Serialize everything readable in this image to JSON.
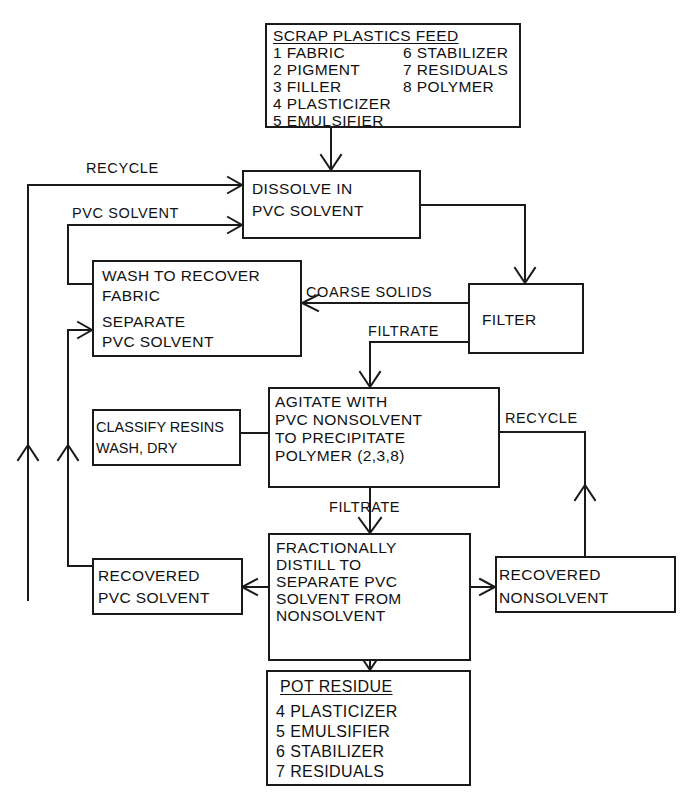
{
  "feed": {
    "title": "SCRAP PLASTICS FEED",
    "items_left": [
      "1  FABRIC",
      "2  PIGMENT",
      "3  FILLER",
      "4  PLASTICIZER",
      "5  EMULSIFIER"
    ],
    "items_right": [
      "6  STABILIZER",
      "7  RESIDUALS",
      "8  POLYMER"
    ]
  },
  "dissolve": {
    "lines": [
      "DISSOLVE  IN",
      "PVC  SOLVENT"
    ]
  },
  "wash": {
    "lines": [
      "WASH  TO  RECOVER",
      "FABRIC",
      "SEPARATE",
      "PVC  SOLVENT"
    ]
  },
  "filter": {
    "label": "FILTER"
  },
  "agitate": {
    "lines": [
      "AGITATE  WITH",
      "PVC  NONSOLVENT",
      "TO  PRECIPITATE",
      "POLYMER  (2,3,8)"
    ]
  },
  "classify": {
    "lines": [
      "CLASSIFY RESINS",
      "WASH, DRY"
    ]
  },
  "distill": {
    "lines": [
      "FRACTIONALLY",
      "DISTILL  TO",
      "SEPARATE  PVC",
      "SOLVENT  FROM",
      "NONSOLVENT"
    ]
  },
  "recovered_solvent": {
    "lines": [
      "RECOVERED",
      "PVC  SOLVENT"
    ]
  },
  "recovered_nonsolvent": {
    "lines": [
      "RECOVERED",
      "NONSOLVENT"
    ]
  },
  "pot_residue": {
    "title": "POT  RESIDUE",
    "items": [
      "4  PLASTICIZER",
      "5  EMULSIFIER",
      "6  STABILIZER",
      "7  RESIDUALS"
    ]
  },
  "edge_labels": {
    "recycle_top": "RECYCLE",
    "pvc_solvent": "PVC SOLVENT",
    "coarse_solids": "COARSE SOLIDS",
    "filtrate_1": "FILTRATE",
    "filtrate_2": "FILTRATE",
    "recycle_right": "RECYCLE"
  },
  "colors": {
    "ink": "#1a1a1a",
    "paper": "#ffffff"
  }
}
